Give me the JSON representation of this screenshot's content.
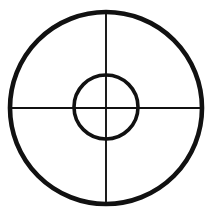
{
  "figure": {
    "name": "crosshair-target",
    "title": "Crosshair target reticle",
    "canvas": {
      "width": 210,
      "height": 223,
      "background_color": "#ffffff"
    },
    "stroke_color": "#111111",
    "fill_color": "none",
    "elements": [
      {
        "id": "outer-circle",
        "shape": "circle",
        "label": "Outer circle",
        "center_x": 106,
        "center_y": 108,
        "radius": 96,
        "stroke_width": 4.6,
        "fill": "none"
      },
      {
        "id": "inner-circle",
        "shape": "circle",
        "label": "Inner circle",
        "center_x": 106,
        "center_y": 107,
        "radius": 32,
        "stroke_width": 3.6,
        "fill": "none"
      },
      {
        "id": "horizontal-crosshair",
        "shape": "line",
        "label": "Horizontal crosshair",
        "x1": 10,
        "y1": 108,
        "x2": 202,
        "y2": 108,
        "stroke_width": 1.9
      },
      {
        "id": "vertical-crosshair",
        "shape": "line",
        "label": "Vertical crosshair",
        "x1": 106,
        "y1": 12,
        "x2": 106,
        "y2": 205,
        "stroke_width": 1.9
      }
    ]
  },
  "chart_data": {
    "type": "diagram",
    "title": "Crosshair target reticle",
    "subtitle": "",
    "xlabel": "",
    "ylabel": "",
    "legend": [],
    "annotations": [],
    "grid": false,
    "center": {
      "x": 106,
      "y": 107
    },
    "rings": [
      {
        "name": "outer",
        "radius": 96,
        "stroke_width": 4.6
      },
      {
        "name": "inner",
        "radius": 32,
        "stroke_width": 3.6
      }
    ],
    "crosshairs": [
      {
        "name": "horizontal",
        "angle_deg": 0,
        "length": 192,
        "stroke_width": 1.9
      },
      {
        "name": "vertical",
        "angle_deg": 90,
        "length": 193,
        "stroke_width": 1.9
      }
    ]
  }
}
